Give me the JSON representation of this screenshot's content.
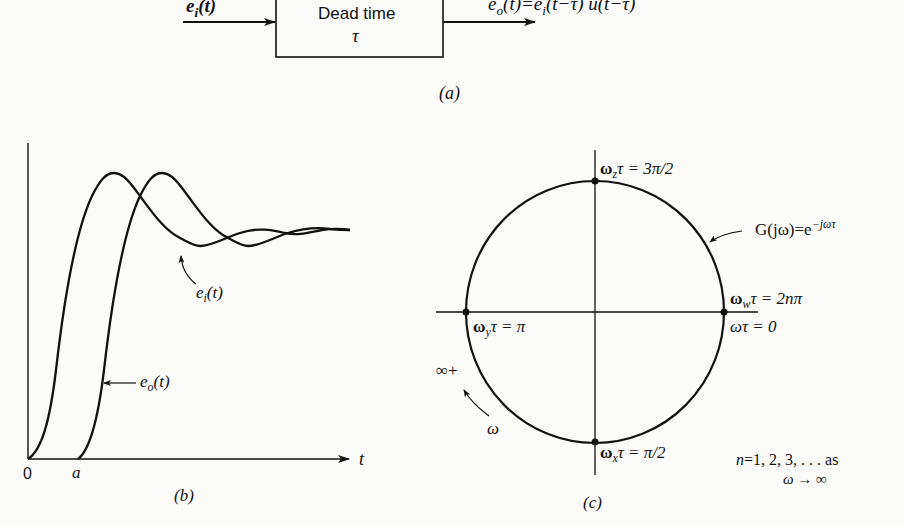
{
  "panel_a": {
    "caption": "(a)",
    "block_label_line1": "Dead time",
    "block_label_line2": "τ",
    "input_signal": "e_i(t)",
    "input_signal_base": "e",
    "input_signal_sub": "i",
    "input_signal_arg": "(t)",
    "output_signal": "e_o(t) = e_i(t − τ) u(t − τ)",
    "output_signal_base": "e",
    "output_signal_sub": "o",
    "output_signal_rest_1": "(t)=e",
    "output_signal_sub2": "i",
    "output_signal_rest_2": "(t−τ) u(t−τ)"
  },
  "panel_b": {
    "caption": "(b)",
    "x_axis_label": "t",
    "origin_label": "0",
    "delay_label": "a",
    "curve_input_label_base": "e",
    "curve_input_label_sub": "i",
    "curve_input_label_arg": "(t)",
    "curve_output_label_base": "e",
    "curve_output_label_sub": "o",
    "curve_output_label_arg": "(t)"
  },
  "panel_c": {
    "caption": "(c)",
    "transfer_fn_label": "G(jω) = e^(−jωτ)",
    "transfer_fn_base": "G(jω)=e",
    "transfer_fn_exp": "−jωτ",
    "point_top": {
      "base": "ω",
      "sub": "z",
      "rest": "τ = 3π/2"
    },
    "point_left": {
      "base": "ω",
      "sub": "y",
      "rest": "τ = π"
    },
    "point_bottom": {
      "base": "ω",
      "sub": "x",
      "rest": "τ = π/2"
    },
    "point_right_upper": {
      "base": "ω",
      "sub": "w",
      "rest": "τ = 2nπ"
    },
    "point_right_lower": "ωτ = 0",
    "infinity_label": "∞+",
    "omega_direction_label": "ω",
    "note_line1": "n = 1, 2, 3, . . . as",
    "note_line1_n": "n",
    "note_line1_rest": "=1, 2, 3, . . . as",
    "note_line2": "ω → ∞"
  }
}
